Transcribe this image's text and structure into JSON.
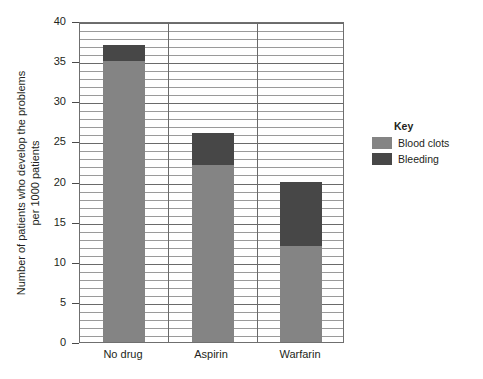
{
  "chart_data": {
    "type": "bar",
    "stacked": true,
    "title": "",
    "xlabel": "",
    "ylabel": "Number of patients who develop the problems per 1000 patients",
    "ylabel_lines": [
      "Number of patients who develop the problems",
      "per 1000 patients"
    ],
    "categories": [
      "No drug",
      "Aspirin",
      "Warfarin"
    ],
    "series": [
      {
        "name": "Blood clots",
        "color": "#848484",
        "values": [
          35,
          22,
          12
        ]
      },
      {
        "name": "Bleeding",
        "color": "#474747",
        "values": [
          2,
          4,
          8
        ]
      }
    ],
    "totals": [
      37,
      26,
      20
    ],
    "ylim": [
      0,
      40
    ],
    "ytick_values": [
      0,
      5,
      10,
      15,
      20,
      25,
      30,
      35,
      40
    ],
    "ytick_labels": [
      "0",
      "5",
      "10",
      "15",
      "20",
      "25",
      "30",
      "35",
      "40"
    ],
    "minor_tick_step": 1,
    "grid": "horizontal-major-and-minor",
    "legend_position": "right",
    "legend": {
      "title": "Key",
      "entries": [
        {
          "label": "Blood clots",
          "color": "#848484"
        },
        {
          "label": "Bleeding",
          "color": "#474747"
        }
      ]
    },
    "colors": {
      "blood_clots": "#848484",
      "bleeding": "#474747",
      "axis": "#6f6f6f",
      "gridline": "#9a9a9a",
      "text": "#231f20",
      "background": "#ffffff"
    }
  }
}
